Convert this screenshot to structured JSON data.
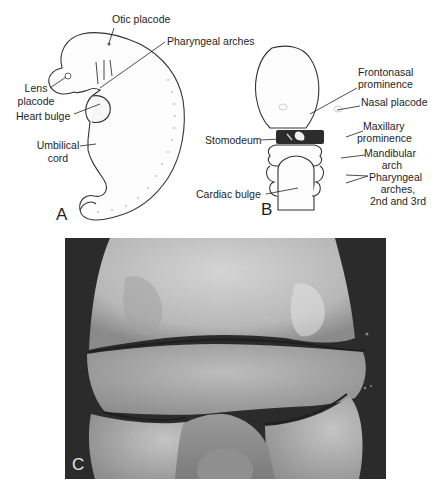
{
  "figure": {
    "panels": [
      {
        "id": "A",
        "letter": "A",
        "description": "Lateral view of embryo",
        "labels": {
          "otic_placode": "Otic placode",
          "pharyngeal_arches": "Pharyngeal arches",
          "lens_placode_line1": "Lens",
          "lens_placode_line2": "placode",
          "heart_bulge": "Heart bulge",
          "umbilical_cord_line1": "Umbilical",
          "umbilical_cord_line2": "cord"
        }
      },
      {
        "id": "B",
        "letter": "B",
        "description": "Frontal view of embryo face",
        "labels": {
          "frontonasal_line1": "Frontonasal",
          "frontonasal_line2": "prominence",
          "nasal_placode": "Nasal placode",
          "stomodeum": "Stomodeum",
          "maxillary_line1": "Maxillary",
          "maxillary_line2": "prominence",
          "mandibular_line1": "Mandibular",
          "mandibular_line2": "arch",
          "pharyngeal_line1": "Pharyngeal",
          "pharyngeal_line2": "arches,",
          "pharyngeal_line3": "2nd and 3rd",
          "cardiac_bulge": "Cardiac bulge"
        }
      },
      {
        "id": "C",
        "letter": "C",
        "description": "Scanning electron micrograph of embryo face"
      }
    ],
    "colors": {
      "ink": "#1e1e1e",
      "paper": "#ffffff",
      "sem_background": "#2b2b2b",
      "sem_tissue_light": "#cfcfcf",
      "sem_tissue_mid": "#a9a9a9",
      "sem_tissue_dark": "#7a7a7a"
    }
  }
}
